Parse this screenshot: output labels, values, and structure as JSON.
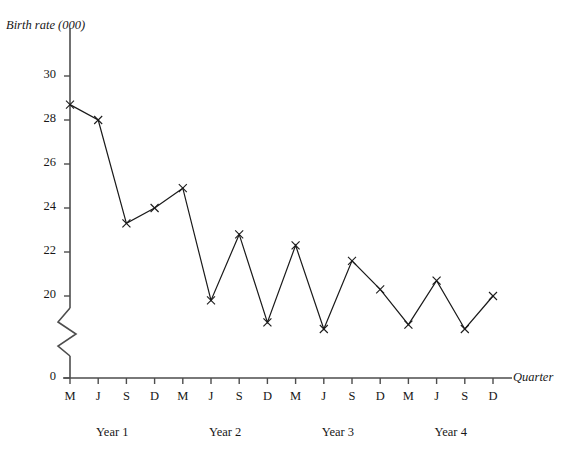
{
  "chart_data": {
    "type": "line",
    "title": "",
    "ylabel": "Birth rate (000)",
    "xlabel": "Quarter",
    "categories": [
      "M",
      "J",
      "S",
      "D",
      "M",
      "J",
      "S",
      "D",
      "M",
      "J",
      "S",
      "D",
      "M",
      "J",
      "S",
      "D"
    ],
    "values": [
      28.7,
      28.0,
      23.3,
      24.0,
      24.9,
      19.8,
      22.8,
      18.8,
      22.3,
      18.5,
      21.6,
      20.3,
      18.7,
      20.7,
      18.5,
      20.0
    ],
    "series": [
      {
        "name": "Birth rate",
        "values": [
          28.7,
          28.0,
          23.3,
          24.0,
          24.9,
          19.8,
          22.8,
          18.8,
          22.3,
          18.5,
          21.6,
          20.3,
          18.7,
          20.7,
          18.5,
          20.0
        ]
      }
    ],
    "groups": [
      {
        "label": "Year 1",
        "quarters": [
          "M",
          "J",
          "S",
          "D"
        ],
        "values": [
          28.7,
          28.0,
          23.3,
          24.0
        ]
      },
      {
        "label": "Year 2",
        "quarters": [
          "M",
          "J",
          "S",
          "D"
        ],
        "values": [
          24.9,
          19.8,
          22.8,
          18.8
        ]
      },
      {
        "label": "Year 3",
        "quarters": [
          "M",
          "J",
          "S",
          "D"
        ],
        "values": [
          22.3,
          18.5,
          21.6,
          20.3
        ]
      },
      {
        "label": "Year 4",
        "quarters": [
          "M",
          "J",
          "S",
          "D"
        ],
        "values": [
          18.7,
          20.7,
          18.5,
          20.0
        ]
      }
    ],
    "ytick_labels": [
      "30",
      "28",
      "26",
      "24",
      "22",
      "20",
      "0"
    ],
    "ytick_values": [
      30,
      28,
      26,
      24,
      22,
      20,
      0
    ],
    "ylim": [
      0,
      31
    ],
    "y_axis_break": true,
    "y_axis_break_note": "zigzag break between 0 and 20",
    "grid": false,
    "legend": "none",
    "marker": "x",
    "line_color": "#1a1a1a",
    "marker_color": "#1a1a1a",
    "axis_color": "#4d4d4d"
  },
  "axes": {
    "y_title": "Birth rate (000)",
    "x_title": "Quarter"
  },
  "year_labels": [
    "Year 1",
    "Year 2",
    "Year 3",
    "Year 4"
  ]
}
